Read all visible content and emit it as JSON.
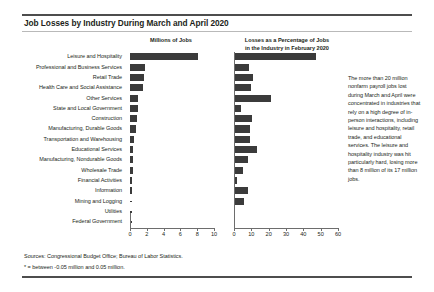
{
  "title": "Job Losses by Industry During March and April 2020",
  "panels": {
    "left_header": "Millions of Jobs",
    "right_header_line1": "Losses as a Percentage of Jobs",
    "right_header_line2": "in the Industry in February 2020"
  },
  "note": "The more than 20 million nonfarm payroll jobs lost during March and April were concentrated in industries that rely on a high degree of in-person interactions, including leisure and hospitality, retail trade, and educational services. The leisure and hospitality industry was hit particularly hard, losing more than 8 million of its 17 million jobs.",
  "sources": "Sources: Congressional Budget Office; Bureau of Labor Statistics.",
  "footnote": "* = between -0.05 million and 0.05 million.",
  "colors": {
    "bar": "#3b3b3b",
    "rule": "#4d4d4d",
    "axis": "#6d6d6d",
    "text": "#231f20"
  },
  "chart_data": {
    "type": "bar",
    "orientation": "horizontal",
    "title": "Job Losses by Industry During March and April 2020",
    "grid": false,
    "legend": "none",
    "categories": [
      "Leisure and Hospitality",
      "Professional and Business Services",
      "Retail Trade",
      "Health Care and Social Assistance",
      "Other Services",
      "State and Local Government",
      "Construction",
      "Manufacturing, Durable Goods",
      "Transportation and Warehousing",
      "Educational Services",
      "Manufacturing, Nondurable Goods",
      "Wholesale Trade",
      "Financial Activities",
      "Information",
      "Mining and Logging",
      "Utilities",
      "Federal Government"
    ],
    "panels": [
      {
        "name": "Millions of Jobs",
        "xlabel": "Millions of Jobs",
        "ylabel": "",
        "xlim": [
          0,
          10
        ],
        "xticks": [
          0,
          2,
          4,
          6,
          8,
          10
        ],
        "xtick_labels": [
          "0",
          "2",
          "4",
          "6",
          "8",
          "10"
        ],
        "values": [
          8.1,
          1.8,
          1.7,
          1.6,
          0.9,
          0.9,
          0.8,
          0.7,
          0.5,
          0.4,
          0.3,
          0.3,
          0.2,
          0.2,
          0.1,
          0.0,
          0.0
        ],
        "special_markers": {
          "Utilities": "*",
          "Federal Government": "*"
        }
      },
      {
        "name": "Losses as a Percentage of Jobs in the Industry in February 2020",
        "xlabel": "Losses as a Percentage of Jobs in the Industry in February 2020",
        "ylabel": "",
        "xlim": [
          0,
          60
        ],
        "xticks": [
          0,
          10,
          20,
          30,
          40,
          50,
          60
        ],
        "xtick_labels": [
          "0",
          "10",
          "20",
          "30",
          "40",
          "50",
          "60"
        ],
        "values": [
          47.5,
          8.8,
          11.0,
          9.6,
          21.5,
          4.0,
          10.5,
          9.0,
          9.4,
          13.0,
          8.0,
          5.0,
          2.0,
          7.8,
          6.0,
          0.4,
          0.3
        ]
      }
    ]
  }
}
